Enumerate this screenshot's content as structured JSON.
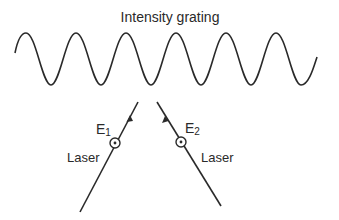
{
  "title": "Intensity grating",
  "beams": [
    {
      "field_label": "E",
      "field_subscript": "1",
      "source_label": "Laser"
    },
    {
      "field_label": "E",
      "field_subscript": "2",
      "source_label": "Laser"
    }
  ],
  "colors": {
    "stroke": "#2a2a2a",
    "background": "#ffffff"
  }
}
